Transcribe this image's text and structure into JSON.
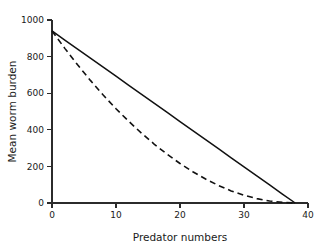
{
  "chart_data": {
    "type": "line",
    "title": "",
    "subtitle": "",
    "xlabel": "Predator numbers",
    "ylabel": "Mean worm burden",
    "xlim": [
      0,
      40
    ],
    "ylim": [
      0,
      1000
    ],
    "xticks": [
      0,
      10,
      20,
      30,
      40
    ],
    "xtick_labels": [
      "0",
      "10",
      "20",
      "30",
      "40"
    ],
    "yticks": [
      0,
      200,
      400,
      600,
      800,
      1000
    ],
    "ytick_labels": [
      "0",
      "200",
      "400",
      "600",
      "800",
      "1000"
    ],
    "grid": false,
    "legend": null,
    "annotations": [],
    "series": [
      {
        "name": "solid-line",
        "style": "solid",
        "color": "#111111",
        "x": [
          0,
          2,
          4,
          6,
          8,
          10,
          12,
          14,
          16,
          18,
          20,
          22,
          24,
          26,
          28,
          30,
          32,
          34,
          36,
          38
        ],
        "values": [
          940,
          890,
          841,
          792,
          742,
          693,
          643,
          594,
          544,
          495,
          445,
          396,
          346,
          297,
          247,
          198,
          148,
          99,
          49,
          0
        ]
      },
      {
        "name": "dashed-line",
        "style": "dashed",
        "color": "#111111",
        "x": [
          0,
          2,
          4,
          6,
          8,
          10,
          12,
          14,
          16,
          18,
          20,
          22,
          24,
          26,
          28,
          30,
          32,
          34,
          36,
          38
        ],
        "values": [
          940,
          845,
          755,
          670,
          590,
          515,
          446,
          381,
          321,
          266,
          216,
          171,
          131,
          96,
          66,
          42,
          24,
          11,
          4,
          0
        ]
      }
    ]
  },
  "axes": {
    "x_title": "Predator numbers",
    "y_title": "Mean worm burden"
  }
}
